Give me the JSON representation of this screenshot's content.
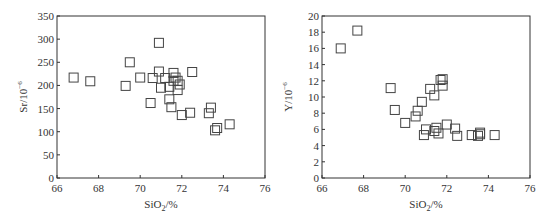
{
  "chart_data": [
    {
      "type": "scatter",
      "title": "",
      "xlabel": "SiO2/%",
      "ylabel": "Sr/10^-6",
      "xlim": [
        66,
        76
      ],
      "ylim": [
        0,
        350
      ],
      "xticks": [
        66,
        68,
        70,
        72,
        74,
        76
      ],
      "yticks": [
        0,
        50,
        100,
        150,
        200,
        250,
        300,
        350
      ],
      "grid": false,
      "marker": "open-square",
      "points": [
        [
          66.8,
          217
        ],
        [
          67.6,
          209
        ],
        [
          69.3,
          199
        ],
        [
          69.5,
          250
        ],
        [
          70.0,
          217
        ],
        [
          70.5,
          162
        ],
        [
          70.6,
          216
        ],
        [
          70.9,
          292
        ],
        [
          70.9,
          230
        ],
        [
          71.0,
          195
        ],
        [
          71.2,
          216
        ],
        [
          71.4,
          197
        ],
        [
          71.4,
          170
        ],
        [
          71.5,
          153
        ],
        [
          71.6,
          227
        ],
        [
          71.6,
          210
        ],
        [
          71.7,
          217
        ],
        [
          71.8,
          190
        ],
        [
          71.8,
          210
        ],
        [
          71.9,
          202
        ],
        [
          72.0,
          136
        ],
        [
          72.4,
          141
        ],
        [
          72.5,
          229
        ],
        [
          73.3,
          140
        ],
        [
          73.4,
          152
        ],
        [
          73.6,
          103
        ],
        [
          73.7,
          108
        ],
        [
          74.3,
          116
        ]
      ]
    },
    {
      "type": "scatter",
      "title": "",
      "xlabel": "SiO2/%",
      "ylabel": "Y/10^-6",
      "xlim": [
        66,
        76
      ],
      "ylim": [
        0,
        20
      ],
      "xticks": [
        66,
        68,
        70,
        72,
        74,
        76
      ],
      "yticks": [
        0,
        2,
        4,
        6,
        8,
        10,
        12,
        14,
        16,
        18,
        20
      ],
      "grid": false,
      "marker": "open-square",
      "points": [
        [
          66.9,
          16.0
        ],
        [
          67.7,
          18.2
        ],
        [
          69.3,
          11.1
        ],
        [
          69.5,
          8.4
        ],
        [
          70.0,
          6.8
        ],
        [
          70.5,
          7.6
        ],
        [
          70.6,
          8.3
        ],
        [
          70.8,
          9.4
        ],
        [
          70.9,
          5.3
        ],
        [
          71.0,
          6.0
        ],
        [
          71.2,
          11.0
        ],
        [
          71.4,
          10.2
        ],
        [
          71.4,
          5.8
        ],
        [
          71.5,
          6.2
        ],
        [
          71.6,
          5.5
        ],
        [
          71.7,
          12.1
        ],
        [
          71.8,
          12.2
        ],
        [
          71.8,
          11.4
        ],
        [
          72.0,
          6.6
        ],
        [
          72.4,
          6.1
        ],
        [
          72.5,
          5.2
        ],
        [
          73.2,
          5.3
        ],
        [
          73.5,
          5.2
        ],
        [
          73.6,
          5.4
        ],
        [
          73.6,
          5.6
        ],
        [
          74.3,
          5.3
        ]
      ]
    }
  ],
  "charts": {
    "left": {
      "ylabel_main": "Sr/10",
      "ylabel_sup": "−6",
      "xlabel_main": "SiO",
      "xlabel_sub": "2",
      "xlabel_tail": "/%"
    },
    "right": {
      "ylabel_main": "Y/10",
      "ylabel_sup": "−6",
      "xlabel_main": "SiO",
      "xlabel_sub": "2",
      "xlabel_tail": "/%"
    }
  }
}
